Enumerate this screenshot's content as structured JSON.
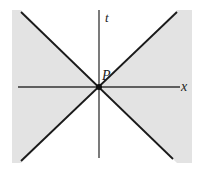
{
  "diagram": {
    "type": "spacetime-light-cone",
    "labels": {
      "t_axis": "t",
      "x_axis": "x",
      "event": "P"
    },
    "colors": {
      "background": "#ffffff",
      "spacelike_region": "#e3e3e3",
      "lines": "#1a1a1a",
      "axes": "#333333"
    },
    "regions": [
      {
        "name": "left-spacelike",
        "shaded": true
      },
      {
        "name": "right-spacelike",
        "shaded": true
      },
      {
        "name": "future-timelike",
        "shaded": false
      },
      {
        "name": "past-timelike",
        "shaded": false
      }
    ]
  }
}
